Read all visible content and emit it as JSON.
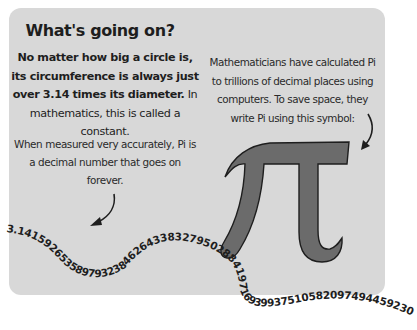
{
  "title": "What's going on?",
  "left_paragraph": {
    "bold": "No matter how big a circle is, its circumference is always just over 3.14 times its diameter.",
    "normal": " In mathematics, this is called a constant."
  },
  "left_paragraph2": "When measured very accurately, Pi is a decimal number that goes on forever.",
  "right_paragraph": "Mathematicians have calculated Pi to trillions of decimal places using computers. To save space, they write Pi using this symbol:",
  "pi_digits": "3.14159265358979323846264338327950288419716939937510582097494459230",
  "icons": {
    "pi_symbol": "pi-symbol",
    "arrow_left": "curved-arrow-down-left",
    "arrow_right": "curved-arrow-down-left"
  },
  "colors": {
    "card": "#d8d8d8",
    "pi_fill": "#6b6b6b",
    "text": "#1e1e1e"
  }
}
